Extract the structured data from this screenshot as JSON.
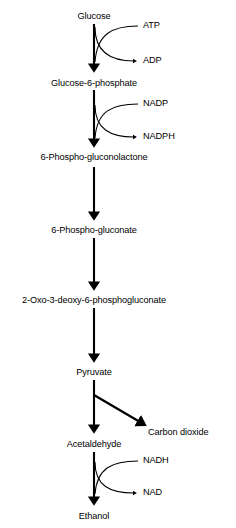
{
  "diagram": {
    "axis_x": 94,
    "colors": {
      "background": "#ffffff",
      "stroke": "#000000",
      "text": "#000000"
    },
    "metabolites": [
      {
        "id": "glucose",
        "label": "Glucose",
        "x": 94,
        "y": 12
      },
      {
        "id": "glucose-6-phosphate",
        "label": "Glucose-6-phosphate",
        "x": 94,
        "y": 79
      },
      {
        "id": "6-phospho-gluconolactone",
        "label": "6-Phospho-gluconolactone",
        "x": 94,
        "y": 153
      },
      {
        "id": "6-phospho-gluconate",
        "label": "6-Phospho-gluconate",
        "x": 94,
        "y": 226
      },
      {
        "id": "2-oxo-3-deoxy-6-phosphogluconate",
        "label": "2-Oxo-3-deoxy-6-phosphogluconate",
        "x": 94,
        "y": 296
      },
      {
        "id": "pyruvate",
        "label": "Pyruvate",
        "x": 94,
        "y": 368
      },
      {
        "id": "acetaldehyde",
        "label": "Acetaldehyde",
        "x": 94,
        "y": 440
      },
      {
        "id": "ethanol",
        "label": "Ethanol",
        "x": 94,
        "y": 512
      }
    ],
    "cofactors": [
      {
        "id": "atp",
        "label": "ATP",
        "x": 143,
        "y": 26,
        "role": "substrate",
        "step": "glucose-to-glucose-6-phosphate"
      },
      {
        "id": "adp",
        "label": "ADP",
        "x": 143,
        "y": 62,
        "role": "product",
        "step": "glucose-to-glucose-6-phosphate"
      },
      {
        "id": "nadp",
        "label": "NADP",
        "x": 143,
        "y": 104,
        "role": "substrate",
        "step": "glucose-6-phosphate-to-6-phospho-gluconolactone"
      },
      {
        "id": "nadph",
        "label": "NADPH",
        "x": 143,
        "y": 138,
        "role": "product",
        "step": "glucose-6-phosphate-to-6-phospho-gluconolactone"
      },
      {
        "id": "nadh",
        "label": "NADH",
        "x": 143,
        "y": 461,
        "role": "substrate",
        "step": "acetaldehyde-to-ethanol"
      },
      {
        "id": "nad",
        "label": "NAD",
        "x": 143,
        "y": 494,
        "role": "product",
        "step": "acetaldehyde-to-ethanol"
      }
    ],
    "side_products": [
      {
        "id": "carbon-dioxide",
        "label": "Carbon dioxide",
        "x": 148,
        "y": 430,
        "step": "pyruvate-to-acetaldehyde"
      }
    ],
    "arrows": [
      {
        "id": "arrow-glucose-to-g6p",
        "type": "vertical",
        "x": 94,
        "y1": 24,
        "y2": 70
      },
      {
        "id": "arrow-g6p-to-gluconolactone",
        "type": "vertical",
        "x": 94,
        "y1": 90,
        "y2": 145
      },
      {
        "id": "arrow-gluconolactone-to-gluconate",
        "type": "vertical",
        "x": 94,
        "y1": 167,
        "y2": 218
      },
      {
        "id": "arrow-gluconate-to-kdpg",
        "type": "vertical",
        "x": 94,
        "y1": 238,
        "y2": 288
      },
      {
        "id": "arrow-kdpg-to-pyruvate",
        "type": "vertical",
        "x": 94,
        "y1": 308,
        "y2": 360
      },
      {
        "id": "arrow-pyruvate-to-acetaldehyde",
        "type": "vertical",
        "x": 94,
        "y1": 380,
        "y2": 431
      },
      {
        "id": "arrow-pyruvate-to-carbon-dioxide",
        "type": "diagonal",
        "x1": 94,
        "y1": 395,
        "x2": 143,
        "y2": 424
      },
      {
        "id": "arrow-acetaldehyde-to-ethanol",
        "type": "vertical",
        "x": 94,
        "y1": 452,
        "y2": 503
      }
    ],
    "cofactor_curves": [
      {
        "id": "curve-atp-in",
        "direction": "in",
        "from_x": 140,
        "from_y": 26,
        "to_x": 94,
        "to_y": 62
      },
      {
        "id": "curve-adp-out",
        "direction": "out",
        "from_x": 94,
        "from_y": 26,
        "to_x": 140,
        "to_y": 62
      },
      {
        "id": "curve-nadp-in",
        "direction": "in",
        "from_x": 140,
        "from_y": 104,
        "to_x": 94,
        "to_y": 138
      },
      {
        "id": "curve-nadph-out",
        "direction": "out",
        "from_x": 94,
        "from_y": 104,
        "to_x": 140,
        "to_y": 138
      },
      {
        "id": "curve-nadh-in",
        "direction": "in",
        "from_x": 140,
        "from_y": 461,
        "to_x": 94,
        "to_y": 494
      },
      {
        "id": "curve-nad-out",
        "direction": "out",
        "from_x": 94,
        "from_y": 461,
        "to_x": 140,
        "to_y": 494
      }
    ]
  }
}
